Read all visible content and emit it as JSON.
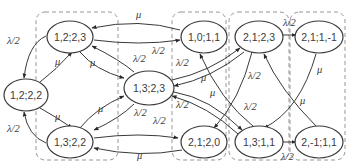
{
  "diagram": {
    "type": "state-transition-diagram",
    "colors": {
      "stroke": "#3a3a3a",
      "group_box": "#8a8a8a",
      "background": "#ffffff"
    },
    "nodes": [
      {
        "id": "n1222",
        "label": "1,2;2,2",
        "x": 26,
        "y": 95
      },
      {
        "id": "n1223",
        "label": "1,2;2,3",
        "x": 70,
        "y": 37
      },
      {
        "id": "n1322",
        "label": "1,3;2,2",
        "x": 70,
        "y": 142
      },
      {
        "id": "n1323",
        "label": "1,3;2,3",
        "x": 149,
        "y": 88
      },
      {
        "id": "n1011",
        "label": "1,0;1,1",
        "x": 204,
        "y": 37
      },
      {
        "id": "n2120",
        "label": "2,1;2,0",
        "x": 204,
        "y": 142
      },
      {
        "id": "n2123",
        "label": "2,1;2,3",
        "x": 259,
        "y": 37
      },
      {
        "id": "n1311",
        "label": "1,3;1,1",
        "x": 259,
        "y": 142
      },
      {
        "id": "n211m1",
        "label": "2,1;1,-1",
        "x": 319,
        "y": 37
      },
      {
        "id": "n2m111",
        "label": "2,-1;1,1",
        "x": 319,
        "y": 142
      }
    ],
    "edges": [
      {
        "from": "1,2;2,3",
        "to": "1,2;2,2",
        "label": "λ/2"
      },
      {
        "from": "1,2;2,2",
        "to": "1,2;2,3",
        "label": "μ"
      },
      {
        "from": "1,3;2,2",
        "to": "1,2;2,2",
        "label": "λ/2"
      },
      {
        "from": "1,2;2,2",
        "to": "1,3;2,2",
        "label": "μ"
      },
      {
        "from": "1,0;1,1",
        "to": "1,2;2,3",
        "label": "μ"
      },
      {
        "from": "1,2;2,3",
        "to": "1,0;1,1",
        "label": "λ/2"
      },
      {
        "from": "1,2;2,3",
        "to": "1,3;2,3",
        "label": "μ"
      },
      {
        "from": "1,3;2,3",
        "to": "1,2;2,3",
        "label": "λ/2"
      },
      {
        "from": "1,3;2,2",
        "to": "1,3;2,3",
        "label": "μ"
      },
      {
        "from": "1,3;2,3",
        "to": "1,3;2,2",
        "label": "λ/2"
      },
      {
        "from": "1,3;2,2",
        "to": "2,1;2,0",
        "label": "λ/2"
      },
      {
        "from": "2,1;2,0",
        "to": "1,3;2,2",
        "label": "μ"
      },
      {
        "from": "1,3;2,3",
        "to": "2,1;2,3",
        "label": "λ/2"
      },
      {
        "from": "2,1;2,3",
        "to": "1,3;2,3",
        "label": "μ"
      },
      {
        "from": "1,3;2,3",
        "to": "1,3;1,1",
        "label": "λ/2"
      },
      {
        "from": "1,3;1,1",
        "to": "1,3;2,3",
        "label": "μ"
      },
      {
        "from": "2,1;2,3",
        "to": "2,1;2,0",
        "label": "λ/2"
      },
      {
        "from": "1,3;1,1",
        "to": "1,0;1,1",
        "label": "λ/2"
      },
      {
        "from": "2,1;2,3",
        "to": "2,1;1,-1",
        "label": "λ/2"
      },
      {
        "from": "2,1;1,-1",
        "to": "1,3;1,1",
        "label": "μ"
      },
      {
        "from": "2,-1;1,1",
        "to": "2,1;2,3",
        "label": "μ"
      },
      {
        "from": "1,3;1,1",
        "to": "2,-1;1,1",
        "label": "λ/2"
      }
    ],
    "edge_labels": {
      "lambda_half": "λ/2",
      "mu": "μ"
    }
  }
}
